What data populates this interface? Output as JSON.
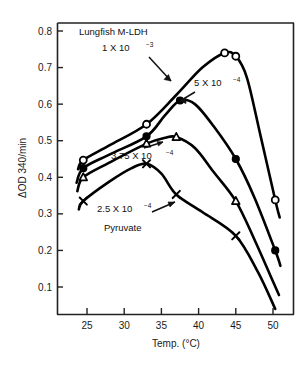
{
  "figure": {
    "title": "Lungfish M-LDH",
    "pyruvate_label": "Pyruvate"
  },
  "axes": {
    "ylabel": "ΔOD 340/min",
    "xlabel": "Temp. (°C)",
    "x_ticks": [
      "25",
      "30",
      "35",
      "40",
      "45",
      "50"
    ],
    "y_ticks": [
      "0.1",
      "0.2",
      "0.3",
      "0.4",
      "0.5",
      "0.6",
      "0.7",
      "0.8"
    ]
  },
  "annotations": {
    "conc_1": {
      "base": "1 X 10",
      "exp": "−3"
    },
    "conc_2": {
      "base": "5 X 10",
      "exp": "−4"
    },
    "conc_3": {
      "base": "3.75 X 10",
      "exp": "−4"
    },
    "conc_4": {
      "base": "2.5 X 10",
      "exp": "−4"
    }
  },
  "chart_data": {
    "type": "line",
    "title": "Lungfish M-LDH",
    "xlabel": "Temp. (°C)",
    "ylabel": "ΔOD 340/min",
    "xlim": [
      22.5,
      51.5
    ],
    "ylim": [
      0.02,
      0.84
    ],
    "x_ticks": [
      25,
      30,
      35,
      40,
      45,
      50
    ],
    "y_ticks": [
      0.1,
      0.2,
      0.3,
      0.4,
      0.5,
      0.6,
      0.7,
      0.8
    ],
    "grid": false,
    "legend": "inline-annotations",
    "series": [
      {
        "name": "1 X 10-3",
        "label": "1 X 10⁻³",
        "marker": "open-circle",
        "points": [
          {
            "x": 24.5,
            "y": 0.447
          },
          {
            "x": 33.0,
            "y": 0.545
          },
          {
            "x": 43.5,
            "y": 0.74
          },
          {
            "x": 45.0,
            "y": 0.731
          },
          {
            "x": 50.3,
            "y": 0.338
          }
        ],
        "curve": [
          {
            "x": 23.8,
            "y": 0.422
          },
          {
            "x": 24.5,
            "y": 0.447
          },
          {
            "x": 28.0,
            "y": 0.487
          },
          {
            "x": 33.0,
            "y": 0.545
          },
          {
            "x": 37.0,
            "y": 0.625
          },
          {
            "x": 40.5,
            "y": 0.7
          },
          {
            "x": 43.5,
            "y": 0.74
          },
          {
            "x": 45.0,
            "y": 0.731
          },
          {
            "x": 46.5,
            "y": 0.672
          },
          {
            "x": 48.3,
            "y": 0.516
          },
          {
            "x": 50.3,
            "y": 0.338
          },
          {
            "x": 50.9,
            "y": 0.29
          }
        ]
      },
      {
        "name": "5 X 10-4",
        "label": "5 X 10⁻⁴",
        "marker": "filled-circle",
        "points": [
          {
            "x": 24.5,
            "y": 0.425
          },
          {
            "x": 33.0,
            "y": 0.512
          },
          {
            "x": 37.5,
            "y": 0.61
          },
          {
            "x": 45.0,
            "y": 0.45
          },
          {
            "x": 50.3,
            "y": 0.2
          }
        ],
        "curve": [
          {
            "x": 23.6,
            "y": 0.385
          },
          {
            "x": 24.5,
            "y": 0.425
          },
          {
            "x": 28.0,
            "y": 0.462
          },
          {
            "x": 33.0,
            "y": 0.512
          },
          {
            "x": 35.5,
            "y": 0.57
          },
          {
            "x": 37.5,
            "y": 0.61
          },
          {
            "x": 39.5,
            "y": 0.6
          },
          {
            "x": 42.0,
            "y": 0.54
          },
          {
            "x": 45.0,
            "y": 0.45
          },
          {
            "x": 47.5,
            "y": 0.345
          },
          {
            "x": 50.3,
            "y": 0.2
          },
          {
            "x": 51.0,
            "y": 0.158
          }
        ]
      },
      {
        "name": "3.75 X 10-4",
        "label": "3.75 X 10⁻⁴",
        "marker": "open-triangle",
        "points": [
          {
            "x": 24.5,
            "y": 0.4
          },
          {
            "x": 33.0,
            "y": 0.492
          },
          {
            "x": 37.0,
            "y": 0.51
          },
          {
            "x": 45.0,
            "y": 0.335
          }
        ],
        "curve": [
          {
            "x": 23.7,
            "y": 0.362
          },
          {
            "x": 24.5,
            "y": 0.4
          },
          {
            "x": 28.0,
            "y": 0.44
          },
          {
            "x": 33.0,
            "y": 0.492
          },
          {
            "x": 35.5,
            "y": 0.508
          },
          {
            "x": 37.0,
            "y": 0.51
          },
          {
            "x": 39.5,
            "y": 0.48
          },
          {
            "x": 42.0,
            "y": 0.415
          },
          {
            "x": 45.0,
            "y": 0.335
          },
          {
            "x": 47.5,
            "y": 0.23
          },
          {
            "x": 50.0,
            "y": 0.115
          },
          {
            "x": 50.8,
            "y": 0.078
          }
        ]
      },
      {
        "name": "2.5 X 10-4",
        "label": "2.5 X 10⁻⁴",
        "marker": "cross-x",
        "points": [
          {
            "x": 24.5,
            "y": 0.335
          },
          {
            "x": 33.0,
            "y": 0.437
          },
          {
            "x": 37.0,
            "y": 0.353
          },
          {
            "x": 45.0,
            "y": 0.24
          }
        ],
        "curve": [
          {
            "x": 23.9,
            "y": 0.312
          },
          {
            "x": 24.5,
            "y": 0.335
          },
          {
            "x": 28.0,
            "y": 0.388
          },
          {
            "x": 31.0,
            "y": 0.425
          },
          {
            "x": 33.0,
            "y": 0.437
          },
          {
            "x": 35.0,
            "y": 0.41
          },
          {
            "x": 37.0,
            "y": 0.353
          },
          {
            "x": 40.5,
            "y": 0.305
          },
          {
            "x": 45.0,
            "y": 0.24
          },
          {
            "x": 48.0,
            "y": 0.14
          },
          {
            "x": 50.3,
            "y": 0.04
          }
        ]
      }
    ]
  }
}
